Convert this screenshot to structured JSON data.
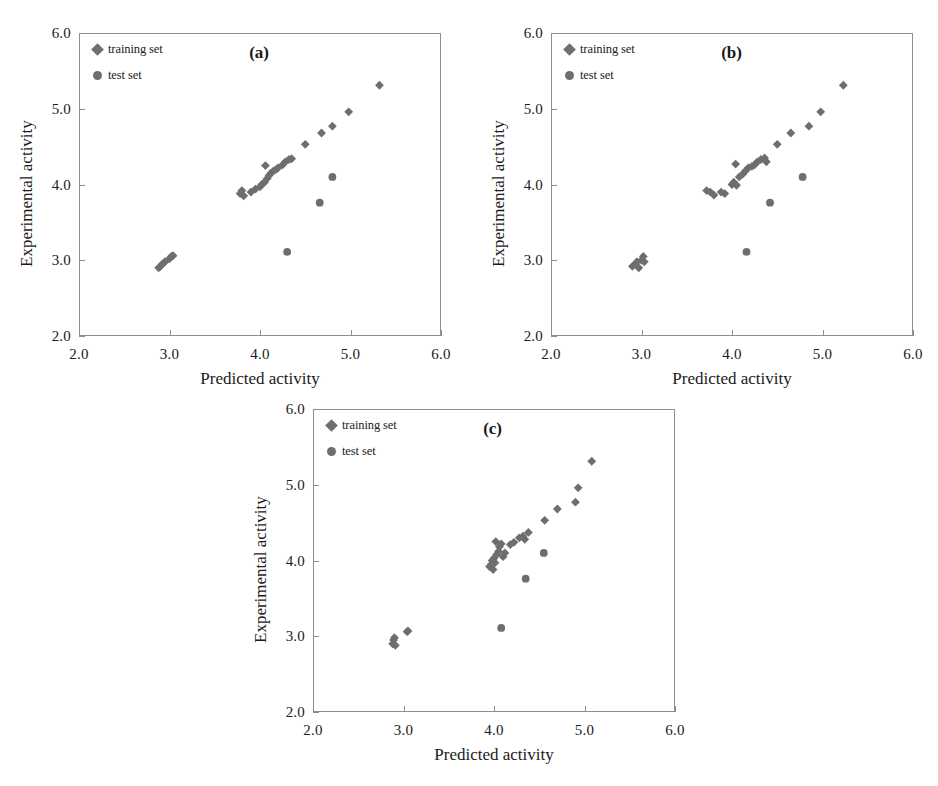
{
  "figure": {
    "marker_color": "#6e6e6e",
    "axis_color": "#8e8e8e",
    "background": "#ffffff"
  },
  "legend": {
    "training_label": "training set",
    "test_label": "test set",
    "training_marker": "diamond-marker-icon",
    "test_marker": "circle-marker-icon"
  },
  "axes": {
    "xlabel": "Predicted activity",
    "ylabel": "Experimental activity",
    "xticks": [
      "2.0",
      "3.0",
      "4.0",
      "5.0",
      "6.0"
    ],
    "yticks": [
      "6.0",
      "5.0",
      "4.0",
      "3.0",
      "2.0"
    ]
  },
  "panels": [
    {
      "id": "a",
      "label": "(a)"
    },
    {
      "id": "b",
      "label": "(b)"
    },
    {
      "id": "c",
      "label": "(c)"
    }
  ],
  "chart_data": [
    {
      "type": "scatter",
      "panel": "(a)",
      "title": "",
      "xlabel": "Predicted activity",
      "ylabel": "Experimental activity",
      "xlim": [
        2.0,
        6.0
      ],
      "ylim": [
        2.0,
        6.0
      ],
      "xticks": [
        2.0,
        3.0,
        4.0,
        5.0,
        6.0
      ],
      "yticks": [
        2.0,
        3.0,
        4.0,
        5.0,
        6.0
      ],
      "grid": false,
      "legend_position": "top-left",
      "series": [
        {
          "name": "training set",
          "marker": "diamond",
          "color": "#6e6e6e",
          "points": [
            [
              2.88,
              2.9
            ],
            [
              2.9,
              2.92
            ],
            [
              2.92,
              2.95
            ],
            [
              2.95,
              2.98
            ],
            [
              3.0,
              3.02
            ],
            [
              3.02,
              3.05
            ],
            [
              3.04,
              3.06
            ],
            [
              3.78,
              3.88
            ],
            [
              3.8,
              3.92
            ],
            [
              3.82,
              3.85
            ],
            [
              3.9,
              3.9
            ],
            [
              3.95,
              3.94
            ],
            [
              4.0,
              3.97
            ],
            [
              4.02,
              4.0
            ],
            [
              4.05,
              4.03
            ],
            [
              4.06,
              4.25
            ],
            [
              4.08,
              4.08
            ],
            [
              4.1,
              4.12
            ],
            [
              4.12,
              4.15
            ],
            [
              4.15,
              4.18
            ],
            [
              4.18,
              4.2
            ],
            [
              4.2,
              4.22
            ],
            [
              4.25,
              4.26
            ],
            [
              4.28,
              4.3
            ],
            [
              4.32,
              4.33
            ],
            [
              4.35,
              4.34
            ],
            [
              4.5,
              4.53
            ],
            [
              4.68,
              4.68
            ],
            [
              4.8,
              4.77
            ],
            [
              4.98,
              4.96
            ],
            [
              5.32,
              5.31
            ]
          ]
        },
        {
          "name": "test set",
          "marker": "circle",
          "color": "#6e6e6e",
          "points": [
            [
              4.8,
              4.1
            ],
            [
              4.66,
              3.76
            ],
            [
              4.3,
              3.11
            ]
          ]
        }
      ]
    },
    {
      "type": "scatter",
      "panel": "(b)",
      "title": "",
      "xlabel": "Predicted activity",
      "ylabel": "Experimental activity",
      "xlim": [
        2.0,
        6.0
      ],
      "ylim": [
        2.0,
        6.0
      ],
      "xticks": [
        2.0,
        3.0,
        4.0,
        5.0,
        6.0
      ],
      "yticks": [
        2.0,
        3.0,
        4.0,
        5.0,
        6.0
      ],
      "grid": false,
      "legend_position": "top-left",
      "series": [
        {
          "name": "training set",
          "marker": "diamond",
          "color": "#6e6e6e",
          "points": [
            [
              2.9,
              2.92
            ],
            [
              2.93,
              2.95
            ],
            [
              2.95,
              2.98
            ],
            [
              2.97,
              2.9
            ],
            [
              3.0,
              3.0
            ],
            [
              3.02,
              3.05
            ],
            [
              3.03,
              2.98
            ],
            [
              3.72,
              3.92
            ],
            [
              3.76,
              3.9
            ],
            [
              3.8,
              3.86
            ],
            [
              3.88,
              3.9
            ],
            [
              3.92,
              3.88
            ],
            [
              4.0,
              4.0
            ],
            [
              4.02,
              4.03
            ],
            [
              4.04,
              4.27
            ],
            [
              4.05,
              3.99
            ],
            [
              4.08,
              4.1
            ],
            [
              4.12,
              4.14
            ],
            [
              4.15,
              4.18
            ],
            [
              4.18,
              4.22
            ],
            [
              4.22,
              4.24
            ],
            [
              4.25,
              4.26
            ],
            [
              4.28,
              4.3
            ],
            [
              4.32,
              4.33
            ],
            [
              4.36,
              4.35
            ],
            [
              4.38,
              4.3
            ],
            [
              4.5,
              4.53
            ],
            [
              4.65,
              4.68
            ],
            [
              4.85,
              4.77
            ],
            [
              4.98,
              4.96
            ],
            [
              5.23,
              5.31
            ]
          ]
        },
        {
          "name": "test set",
          "marker": "circle",
          "color": "#6e6e6e",
          "points": [
            [
              4.78,
              4.1
            ],
            [
              4.42,
              3.76
            ],
            [
              4.16,
              3.11
            ]
          ]
        }
      ]
    },
    {
      "type": "scatter",
      "panel": "(c)",
      "title": "",
      "xlabel": "Predicted activity",
      "ylabel": "Experimental activity",
      "xlim": [
        2.0,
        6.0
      ],
      "ylim": [
        2.0,
        6.0
      ],
      "xticks": [
        2.0,
        3.0,
        4.0,
        5.0,
        6.0
      ],
      "yticks": [
        2.0,
        3.0,
        4.0,
        5.0,
        6.0
      ],
      "grid": false,
      "legend_position": "top-left",
      "series": [
        {
          "name": "training set",
          "marker": "diamond",
          "color": "#6e6e6e",
          "points": [
            [
              2.88,
              2.9
            ],
            [
              2.89,
              2.95
            ],
            [
              2.9,
              2.98
            ],
            [
              2.91,
              2.88
            ],
            [
              3.04,
              3.06
            ],
            [
              3.05,
              3.07
            ],
            [
              3.95,
              3.92
            ],
            [
              3.97,
              3.95
            ],
            [
              3.98,
              4.0
            ],
            [
              3.99,
              3.88
            ],
            [
              4.0,
              4.03
            ],
            [
              4.01,
              3.97
            ],
            [
              4.02,
              4.25
            ],
            [
              4.03,
              4.08
            ],
            [
              4.05,
              4.12
            ],
            [
              4.06,
              4.18
            ],
            [
              4.08,
              4.22
            ],
            [
              4.1,
              4.05
            ],
            [
              4.12,
              4.1
            ],
            [
              4.18,
              4.21
            ],
            [
              4.22,
              4.24
            ],
            [
              4.28,
              4.3
            ],
            [
              4.32,
              4.32
            ],
            [
              4.34,
              4.28
            ],
            [
              4.38,
              4.37
            ],
            [
              4.56,
              4.53
            ],
            [
              4.7,
              4.68
            ],
            [
              4.9,
              4.77
            ],
            [
              4.93,
              4.96
            ],
            [
              5.08,
              5.31
            ]
          ]
        },
        {
          "name": "test set",
          "marker": "circle",
          "color": "#6e6e6e",
          "points": [
            [
              4.55,
              4.1
            ],
            [
              4.35,
              3.76
            ],
            [
              4.08,
              3.11
            ]
          ]
        }
      ]
    }
  ]
}
